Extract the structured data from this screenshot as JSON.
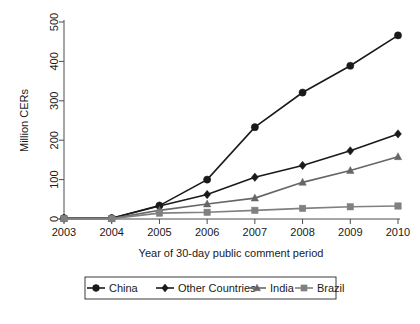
{
  "chart_data": {
    "type": "line",
    "title": "",
    "xlabel": "Year of 30-day public comment period",
    "ylabel": "Million CERs",
    "categories": [
      "2003",
      "2004",
      "2005",
      "2006",
      "2007",
      "2008",
      "2009",
      "2010"
    ],
    "x": [
      2003,
      2004,
      2005,
      2006,
      2007,
      2008,
      2009,
      2010
    ],
    "xlim": [
      2003,
      2010
    ],
    "ylim": [
      0,
      500
    ],
    "yticks": [
      0,
      100,
      200,
      300,
      400,
      500
    ],
    "ytick_labels": [
      "0",
      "100",
      "200",
      "300",
      "400",
      "500"
    ],
    "xtick_labels": [
      "2003",
      "2004",
      "2005",
      "2006",
      "2007",
      "2008",
      "2009",
      "2010"
    ],
    "grid": false,
    "legend_position": "below-bottom",
    "series": [
      {
        "name": "China",
        "marker": "circle",
        "color": "#1a1a1a",
        "values": [
          2,
          2,
          34,
          100,
          233,
          321,
          389,
          466
        ]
      },
      {
        "name": "Other Countries",
        "marker": "diamond",
        "color": "#1a1a1a",
        "values": [
          2,
          2,
          33,
          62,
          106,
          136,
          173,
          216
        ]
      },
      {
        "name": "India",
        "marker": "triangle",
        "color": "#666666",
        "values": [
          1,
          1,
          22,
          38,
          53,
          93,
          123,
          158
        ]
      },
      {
        "name": "Brazil",
        "marker": "square",
        "color": "#808080",
        "values": [
          1,
          1,
          15,
          17,
          22,
          27,
          31,
          33
        ]
      }
    ]
  },
  "legend": {
    "items": [
      {
        "label": "China",
        "marker": "circle",
        "color": "#1a1a1a"
      },
      {
        "label": "Other Countries",
        "marker": "diamond",
        "color": "#1a1a1a"
      },
      {
        "label": "India",
        "marker": "triangle",
        "color": "#666666"
      },
      {
        "label": "Brazil",
        "marker": "square",
        "color": "#808080"
      }
    ]
  },
  "colors": {
    "china": "#1a1a1a",
    "other_countries": "#1a1a1a",
    "india": "#666666",
    "brazil": "#808080",
    "axis": "#4d4d4d",
    "background": "#ffffff"
  }
}
